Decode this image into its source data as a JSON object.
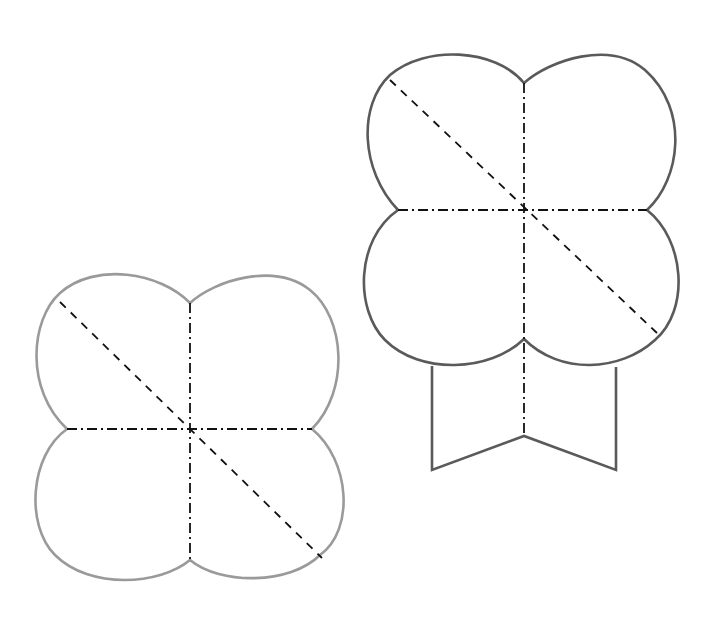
{
  "diagram": {
    "colors": {
      "background": "#ffffff",
      "left_outline": "#9a9a9a",
      "right_outline": "#5a5a5a",
      "fold_lines": "#111111"
    },
    "line_styles": {
      "dash_dot": "mountain/valley fold (horizontal and vertical center lines)",
      "dashed": "diagonal fold line"
    },
    "figures": [
      {
        "id": "clover",
        "center": [
          190,
          428
        ],
        "lobes": 4,
        "fold_lines": [
          "vertical dash-dot",
          "horizontal dash-dot",
          "diagonal dashed top-left to bottom-right"
        ]
      },
      {
        "id": "clover-with-tab",
        "center": [
          524,
          210
        ],
        "lobes": 4,
        "tab": "rectangular tab with V-notch at bottom",
        "fold_lines": [
          "vertical dash-dot extending into tab",
          "horizontal dash-dot",
          "diagonal dashed top-left to bottom-right"
        ]
      }
    ]
  }
}
